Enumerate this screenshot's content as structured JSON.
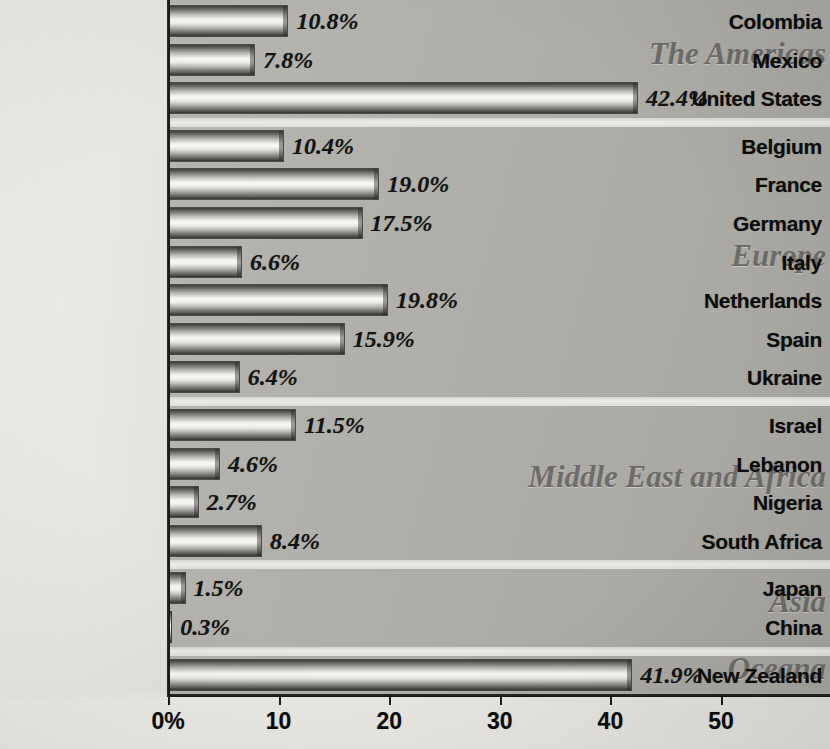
{
  "chart_data": {
    "type": "bar",
    "orientation": "horizontal",
    "title": "",
    "xlabel": "",
    "ylabel": "",
    "xlim": [
      0,
      54
    ],
    "grid": false,
    "legend": null,
    "tick_labels": [
      "0%",
      "10",
      "20",
      "30",
      "40",
      "50"
    ],
    "tick_values": [
      0,
      10,
      20,
      30,
      40,
      50
    ],
    "categories": [
      "Colombia",
      "Mexico",
      "United States",
      "Belgium",
      "France",
      "Germany",
      "Italy",
      "Netherlands",
      "Spain",
      "Ukraine",
      "Israel",
      "Lebanon",
      "Nigeria",
      "South Africa",
      "Japan",
      "China",
      "New Zealand"
    ],
    "values": [
      10.8,
      7.8,
      42.4,
      10.4,
      19.0,
      17.5,
      6.6,
      19.8,
      15.9,
      6.4,
      11.5,
      4.6,
      2.7,
      8.4,
      1.5,
      0.3,
      41.9
    ],
    "value_labels": [
      "10.8%",
      "7.8%",
      "42.4%",
      "10.4%",
      "19.0%",
      "17.5%",
      "6.6%",
      "19.8%",
      "15.9%",
      "6.4%",
      "11.5%",
      "4.6%",
      "2.7%",
      "8.4%",
      "1.5%",
      "0.3%",
      "41.9%"
    ],
    "groups": [
      {
        "label": "The Americas",
        "count": 3
      },
      {
        "label": "Europe",
        "count": 7
      },
      {
        "label": "Middle East and Africa",
        "count": 4
      },
      {
        "label": "Asia",
        "count": 2
      },
      {
        "label": "Oceana",
        "count": 1
      }
    ],
    "colors": {
      "bar_dark": "#333331",
      "bar_light": "#fbfaf7",
      "plot_background": "#b3b1ac",
      "label_background": "#eceae5",
      "region_label": "#6e6c68",
      "text": "#0b0b0b"
    }
  }
}
